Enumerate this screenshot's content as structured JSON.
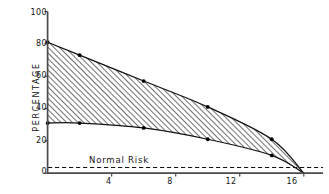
{
  "chart_data": {
    "type": "area",
    "title": "",
    "xlabel": "",
    "ylabel": "PERCENTAGE",
    "xlim": [
      0,
      17.2
    ],
    "ylim": [
      0,
      100
    ],
    "grid": false,
    "legend_position": "none",
    "x_ticks": [
      4,
      8,
      12,
      16
    ],
    "y_ticks": [
      0,
      20,
      40,
      60,
      80,
      100
    ],
    "series": [
      {
        "name": "upper-bound",
        "x": [
          0,
          2,
          6,
          10,
          14,
          16
        ],
        "values": [
          81,
          73,
          57,
          41,
          21,
          0
        ]
      },
      {
        "name": "lower-bound",
        "x": [
          0,
          2,
          6,
          10,
          14,
          16
        ],
        "values": [
          31,
          31,
          28,
          21,
          11,
          0
        ]
      }
    ],
    "annotations": [
      {
        "name": "normal-risk",
        "label": "Normal Risk",
        "type": "hline",
        "value": 3.5,
        "style": "dashed"
      }
    ],
    "shaded_band": {
      "between": [
        "upper-bound",
        "lower-bound"
      ],
      "fill": "diagonal-hatch"
    }
  },
  "axis": {
    "y_title": "PERCENTAGE",
    "y_tick_labels": [
      "0",
      "20",
      "40",
      "60",
      "80",
      "100"
    ],
    "x_tick_labels": [
      "4",
      "8",
      "12",
      "16"
    ]
  },
  "annotation": {
    "normal_risk_label": "Normal Risk"
  },
  "colors": {
    "axis": "#4a4a4a",
    "curve": "#111111",
    "marker": "#000000",
    "hatch": "#2b2b2b",
    "text": "#141414",
    "background": "#ffffff"
  }
}
